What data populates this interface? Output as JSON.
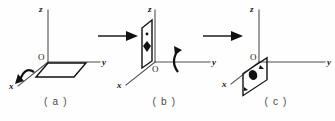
{
  "figure": {
    "background_color": "#fefefe",
    "ink_color": "#111111",
    "axis_color": "#4d4d4d"
  },
  "panels": [
    {
      "id": "a",
      "caption": "( a )",
      "axes": {
        "z": "z",
        "y": "y",
        "x": "x",
        "origin": "O"
      },
      "plane": {
        "name": "horizontal-hatched-plane",
        "orientation": "horizontal",
        "fill": "diagonal-hatch",
        "description": "hatched parallelogram lying in the x-y plane"
      },
      "rotation": {
        "name": "rotation-about-x-axis",
        "axis": "x",
        "glyph": "curved-arrow"
      }
    },
    {
      "id": "b",
      "caption": "( b )",
      "axes": {
        "z": "z",
        "y": "y",
        "x": "x",
        "origin": "O"
      },
      "plane": {
        "name": "vertical-plane",
        "orientation": "vertical",
        "fill": "white",
        "markers": [
          "small-dot",
          "filled-arrowhead"
        ],
        "description": "upright parallelogram standing in the x-z plane"
      },
      "rotation": {
        "name": "rotation-about-y-axis",
        "axis": "y",
        "glyph": "curved-arrow"
      }
    },
    {
      "id": "c",
      "caption": "( c )",
      "axes": {
        "z": "z",
        "y": "y",
        "x": "x",
        "origin": "O"
      },
      "plane": {
        "name": "tilted-plane",
        "orientation": "tilted",
        "fill": "white",
        "markers": [
          "filled-blob",
          "small-arrowhead"
        ],
        "description": "tilted parallelogram hanging below the y-axis"
      },
      "rotation": null
    }
  ],
  "flow_arrows": [
    {
      "name": "flow-arrow-a-to-b",
      "direction": "right"
    },
    {
      "name": "flow-arrow-b-to-c",
      "direction": "right"
    }
  ]
}
